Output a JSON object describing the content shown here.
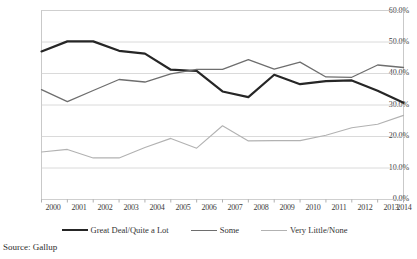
{
  "chart_data": {
    "type": "line",
    "title": "",
    "subtitle": "",
    "xlabel": "",
    "ylabel": "",
    "x": [
      2000,
      2001,
      2002,
      2003,
      2004,
      2005,
      2006,
      2007,
      2008,
      2009,
      2010,
      2011,
      2012,
      2013,
      2014
    ],
    "categories": [
      "2000",
      "2001",
      "2002",
      "2003",
      "2004",
      "2005",
      "2006",
      "2007",
      "2008",
      "2009",
      "2010",
      "2011",
      "2012",
      "2013",
      "2014"
    ],
    "ylim": [
      0,
      60
    ],
    "ytick_values": [
      0,
      10,
      20,
      30,
      40,
      50,
      60
    ],
    "ytick_labels": [
      "0.0%",
      "10.0%",
      "20.0%",
      "30.0%",
      "40.0%",
      "50.0%",
      "60.0%"
    ],
    "grid": true,
    "legend_position": "bottom",
    "series": [
      {
        "name": "Great Deal/Quite a Lot",
        "color": "#262626",
        "width": 2.2,
        "values": [
          47.0,
          50.2,
          50.2,
          47.2,
          46.3,
          41.2,
          40.8,
          34.3,
          32.5,
          39.6,
          36.6,
          37.6,
          37.8,
          34.5,
          30.7
        ]
      },
      {
        "name": "Some",
        "color": "#6e6e6e",
        "width": 1.3,
        "values": [
          34.9,
          31.1,
          34.6,
          38.1,
          37.3,
          39.9,
          41.3,
          41.3,
          44.4,
          41.4,
          43.6,
          38.9,
          38.8,
          42.7,
          41.9
        ]
      },
      {
        "name": "Very Little/None",
        "color": "#b2b2b2",
        "width": 1.1,
        "values": [
          15.1,
          15.9,
          13.2,
          13.2,
          16.5,
          19.4,
          16.3,
          23.4,
          18.6,
          18.7,
          18.7,
          20.4,
          22.8,
          23.9,
          26.7
        ]
      }
    ]
  },
  "legend": {
    "items": [
      {
        "label": "Great Deal/Quite a Lot"
      },
      {
        "label": "Some"
      },
      {
        "label": "Very Little/None"
      }
    ]
  },
  "source": {
    "text": "Source: Gallup"
  }
}
